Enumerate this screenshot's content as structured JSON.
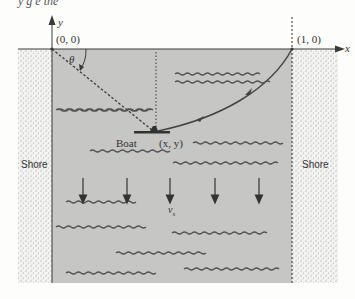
{
  "figure": {
    "cut_off_caption": "y g e the",
    "axes": {
      "x_label": "x",
      "y_label": "y",
      "origin_label": "(0, 0)",
      "far_point_label": "(1, 0)"
    },
    "angle_label": "θ",
    "boat_label": "Boat",
    "boat_position_label": "(x, y)",
    "current_label": "v",
    "current_subscript": "s",
    "left_shore_label": "Shore",
    "right_shore_label": "Shore",
    "colors": {
      "water": "#c6c6c4",
      "shore_dots": "#8a8a88",
      "lines": "#3a3a3a",
      "background": "#fdfdfb"
    }
  }
}
